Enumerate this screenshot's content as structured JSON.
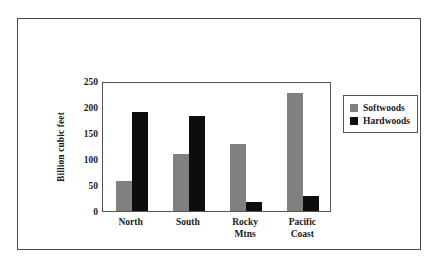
{
  "chart_data": {
    "type": "bar",
    "title": "",
    "subtitle": "",
    "xlabel": "",
    "ylabel": "Billion cubic feet",
    "categories": [
      "North",
      "South",
      "Rocky Mtns",
      "Pacific Coast"
    ],
    "category_lines": [
      [
        "North"
      ],
      [
        "South"
      ],
      [
        "Rocky",
        "Mtns"
      ],
      [
        "Pacific",
        "Coast"
      ]
    ],
    "series": [
      {
        "name": "Softwoods",
        "color": "#808080",
        "values": [
          57,
          109,
          128,
          227
        ]
      },
      {
        "name": "Hardwoods",
        "color": "#0d0d0d",
        "values": [
          190,
          183,
          17,
          29
        ]
      }
    ],
    "ylim": [
      0,
      250
    ],
    "yticks": [
      0,
      50,
      100,
      150,
      200,
      250
    ],
    "ytick_labels": [
      "0",
      "50",
      "100",
      "150",
      "200",
      "250"
    ],
    "grid": false,
    "legend_position": "right",
    "legend_entries": [
      "Softwoods",
      "Hardwoods"
    ]
  },
  "colors": {
    "softwoods": "#808080",
    "hardwoods": "#0d0d0d",
    "frame_border": "#4a4a4a",
    "plot_border": "#555555",
    "text": "#1a1a1a",
    "background": "#ffffff"
  }
}
